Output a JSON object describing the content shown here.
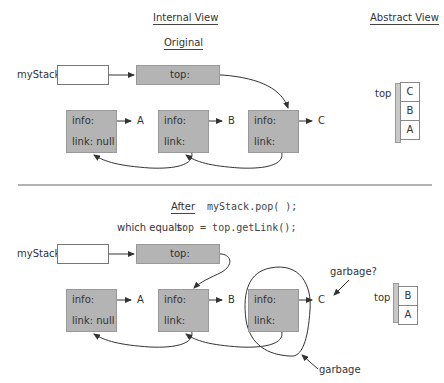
{
  "headings": {
    "internal_view": "Internal View",
    "abstract_view": "Abstract View",
    "original": "Original",
    "after": "After"
  },
  "code": {
    "pop_call": "myStack.pop( );",
    "equals_label": "which equals:",
    "equals_code": "top = top.getLink();"
  },
  "original": {
    "mystack_label": "myStack:",
    "top_label": "top:",
    "nodes": [
      {
        "info": "info:",
        "link": "link: null",
        "value": "A"
      },
      {
        "info": "info:",
        "link": "link:",
        "value": "B"
      },
      {
        "info": "info:",
        "link": "link:",
        "value": "C"
      }
    ],
    "abstract": {
      "top_label": "top",
      "cells": [
        "C",
        "B",
        "A"
      ]
    }
  },
  "after": {
    "mystack_label": "myStack:",
    "top_label": "top:",
    "nodes": [
      {
        "info": "info:",
        "link": "link: null",
        "value": "A"
      },
      {
        "info": "info:",
        "link": "link:",
        "value": "B"
      },
      {
        "info": "info:",
        "link": "link:",
        "value": "C"
      }
    ],
    "garbage_question": "garbage?",
    "garbage": "garbage",
    "abstract": {
      "top_label": "top",
      "cells": [
        "B",
        "A"
      ]
    }
  },
  "colors": {
    "node_fill": "#b4b4b4",
    "line": "#333333",
    "text": "#333333"
  }
}
